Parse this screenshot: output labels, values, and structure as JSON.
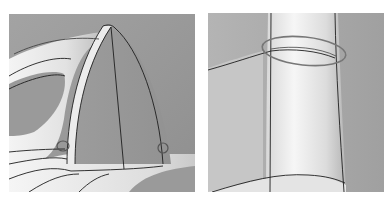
{
  "figure": {
    "panels": [
      {
        "id": "left",
        "subject": "iron-shaped-surface-model-with-triangular-face",
        "annotations": [
          "circle-marker-left-corner",
          "circle-marker-right-corner"
        ],
        "colors": {
          "background": "#9a9a9a",
          "surface_light": "#f2f2f2",
          "edge_line": "#222222",
          "marker": "#6a6a6a"
        }
      },
      {
        "id": "right",
        "subject": "cylindrical-surface-with-seam",
        "annotations": [
          "ellipse-marker-top-seam"
        ],
        "colors": {
          "background": "#a8a8a8",
          "surface_light": "#f0f0f0",
          "edge_line": "#222222",
          "marker": "#777777"
        }
      }
    ]
  }
}
